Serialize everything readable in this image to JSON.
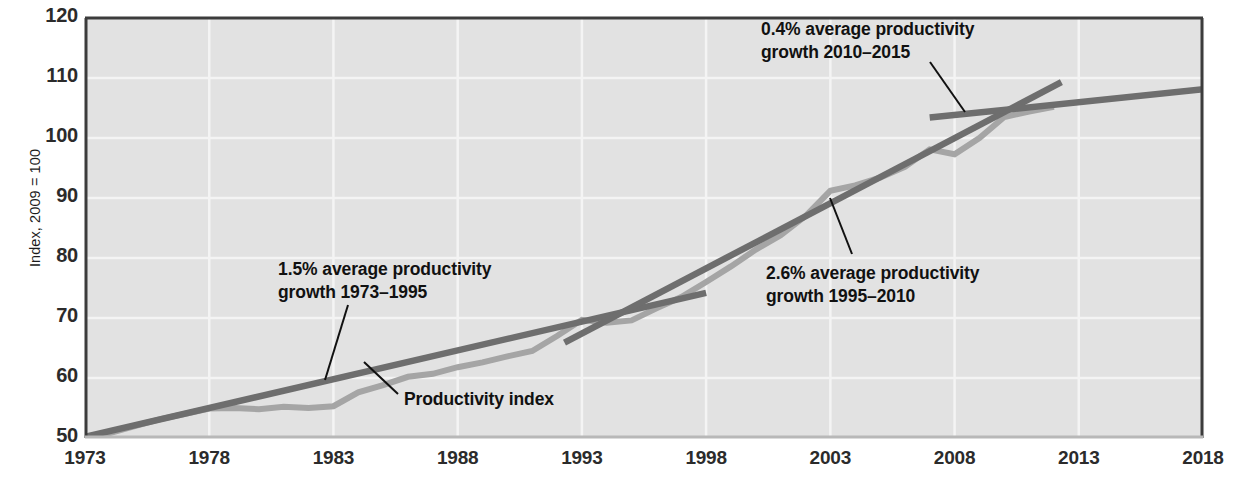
{
  "chart_data": {
    "type": "line",
    "title": "",
    "xlabel": "",
    "ylabel": "Index, 2009 = 100",
    "xlim": [
      1973,
      2018
    ],
    "ylim": [
      50,
      120
    ],
    "grid": true,
    "legend_position": "none",
    "x_ticks": [
      "1973",
      "1978",
      "1983",
      "1988",
      "1993",
      "1998",
      "2003",
      "2008",
      "2013",
      "2018"
    ],
    "y_ticks": [
      "50",
      "60",
      "70",
      "80",
      "90",
      "100",
      "110",
      "120"
    ],
    "series": [
      {
        "name": "Productivity index",
        "color": "#a5a5a5",
        "x": [
          1973,
          1974,
          1975,
          1976,
          1977,
          1978,
          1979,
          1980,
          1981,
          1982,
          1983,
          1984,
          1985,
          1986,
          1987,
          1988,
          1989,
          1990,
          1991,
          1992,
          1993,
          1994,
          1995,
          1996,
          1997,
          1998,
          1999,
          2000,
          2001,
          2002,
          2003,
          2004,
          2005,
          2006,
          2007,
          2008,
          2009,
          2010,
          2011,
          2012
        ],
        "values": [
          50.0,
          50.8,
          52.0,
          53.1,
          54.0,
          54.9,
          55.0,
          54.8,
          55.2,
          55.0,
          55.3,
          57.6,
          58.8,
          60.2,
          60.7,
          61.8,
          62.6,
          63.6,
          64.5,
          67.0,
          69.7,
          69.2,
          69.6,
          71.6,
          73.5,
          76.0,
          78.6,
          81.4,
          83.8,
          87.0,
          91.2,
          92.1,
          93.4,
          95.2,
          98.1,
          97.3,
          100.0,
          103.5,
          104.4,
          105.2
        ]
      },
      {
        "name": "1973-1995 trend",
        "color": "#6e6e6e",
        "x": [
          1973,
          1998
        ],
        "values": [
          50.2,
          74.2
        ]
      },
      {
        "name": "1995-2010 trend",
        "color": "#6e6e6e",
        "x": [
          1992.3,
          2012.3
        ],
        "values": [
          65.9,
          109.3
        ]
      },
      {
        "name": "2010-2015 trend",
        "color": "#6e6e6e",
        "x": [
          2007.0,
          2018.2
        ],
        "values": [
          103.4,
          108.2
        ]
      }
    ],
    "annotations": [
      {
        "id": "annot-1973-1995",
        "text": "1.5% average productivity\ngrowth 1973–1995",
        "x_px": 278,
        "y_px": 258,
        "leader": {
          "x1": 348,
          "y1": 305,
          "x2": 325,
          "y2": 380
        }
      },
      {
        "id": "annot-1995-2010",
        "text": "2.6% average productivity\ngrowth 1995–2010",
        "x_px": 766,
        "y_px": 262,
        "leader": {
          "x1": 852,
          "y1": 254,
          "x2": 830,
          "y2": 198
        }
      },
      {
        "id": "annot-2010-2015",
        "text": "0.4% average productivity\ngrowth 2010–2015",
        "x_px": 761,
        "y_px": 18,
        "leader": {
          "x1": 930,
          "y1": 62,
          "x2": 965,
          "y2": 112
        }
      },
      {
        "id": "annot-series-label",
        "text": "Productivity index",
        "x_px": 404,
        "y_px": 388,
        "leader": {
          "x1": 398,
          "y1": 394,
          "x2": 364,
          "y2": 362
        }
      }
    ],
    "colors": {
      "plot_background": "#e2e2e2",
      "gridline": "#f4f4f4",
      "axis_border": "#3c3c3c",
      "index_line": "#a5a5a5",
      "trend_line": "#6e6e6e",
      "text": "#1b1b1b"
    }
  }
}
